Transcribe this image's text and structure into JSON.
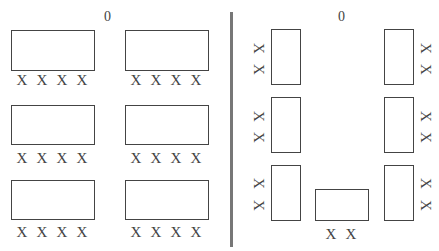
{
  "title_cut": "",
  "layouts": [
    {
      "name": "rows",
      "teacher_marker": "0",
      "tables": [
        {
          "x": 11,
          "y": 30,
          "w": 84,
          "h": 41,
          "seats": [
            "X",
            "X",
            "X",
            "X"
          ]
        },
        {
          "x": 125,
          "y": 30,
          "w": 84,
          "h": 41,
          "seats": [
            "X",
            "X",
            "X",
            "X"
          ]
        },
        {
          "x": 11,
          "y": 105,
          "w": 84,
          "h": 40,
          "seats": [
            "X",
            "X",
            "X",
            "X"
          ]
        },
        {
          "x": 125,
          "y": 105,
          "w": 84,
          "h": 40,
          "seats": [
            "X",
            "X",
            "X",
            "X"
          ]
        },
        {
          "x": 11,
          "y": 180,
          "w": 84,
          "h": 40,
          "seats": [
            "X",
            "X",
            "X",
            "X"
          ]
        },
        {
          "x": 125,
          "y": 180,
          "w": 84,
          "h": 40,
          "seats": [
            "X",
            "X",
            "X",
            "X"
          ]
        }
      ]
    },
    {
      "name": "u-shape",
      "teacher_marker": "0",
      "tables": [
        {
          "x": 271,
          "y": 29,
          "w": 30,
          "h": 56,
          "seats": [
            "X",
            "X"
          ],
          "side": "left"
        },
        {
          "x": 384,
          "y": 29,
          "w": 30,
          "h": 56,
          "seats": [
            "X",
            "X"
          ],
          "side": "right"
        },
        {
          "x": 271,
          "y": 97,
          "w": 30,
          "h": 56,
          "seats": [
            "X",
            "X"
          ],
          "side": "left"
        },
        {
          "x": 384,
          "y": 97,
          "w": 30,
          "h": 56,
          "seats": [
            "X",
            "X"
          ],
          "side": "right"
        },
        {
          "x": 271,
          "y": 165,
          "w": 30,
          "h": 56,
          "seats": [
            "X",
            "X"
          ],
          "side": "left"
        },
        {
          "x": 315,
          "y": 189,
          "w": 54,
          "h": 32,
          "seats": [
            "X",
            "X"
          ],
          "side": "bottom"
        },
        {
          "x": 384,
          "y": 165,
          "w": 30,
          "h": 56,
          "seats": [
            "X",
            "X"
          ],
          "side": "right"
        }
      ]
    }
  ],
  "colors": {
    "stroke": "#444444",
    "divider": "#777777"
  }
}
